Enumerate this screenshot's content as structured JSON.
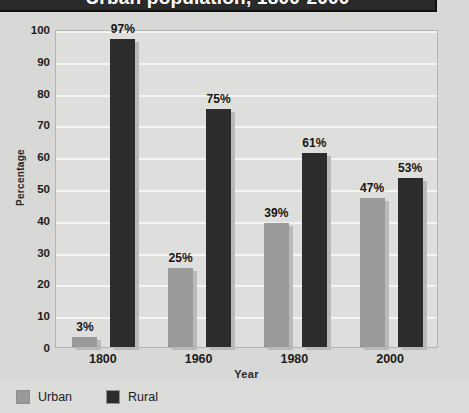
{
  "title": {
    "text": "Urban population, 1800-2000"
  },
  "axes": {
    "y_title": "Percentage",
    "x_title": "Year",
    "y_ticks": [
      "100",
      "90",
      "80",
      "70",
      "60",
      "50",
      "40",
      "30",
      "20",
      "10",
      "0"
    ],
    "x_ticks": [
      "1800",
      "1960",
      "1980",
      "2000"
    ]
  },
  "legend": {
    "items": [
      {
        "label": "Urban",
        "color": "#9a9a9a"
      },
      {
        "label": "Rural",
        "color": "#2c2c2c"
      }
    ]
  },
  "colors": {
    "urban": "#9a9a9a",
    "rural": "#2c2c2c",
    "plot_background": "#dededc",
    "page_background": "#d8d8d6",
    "gridline": "#f4f4f2",
    "banner": "#2a2a2a"
  },
  "bar_labels": {
    "g0_urban": "3%",
    "g0_rural": "97%",
    "g1_urban": "25%",
    "g1_rural": "75%",
    "g2_urban": "39%",
    "g2_rural": "61%",
    "g3_urban": "47%",
    "g3_rural": "53%"
  },
  "chart_data": {
    "type": "bar",
    "title": "Urban population, 1800-2000",
    "xlabel": "Year",
    "ylabel": "Percentage",
    "ylim": [
      0,
      100
    ],
    "ytick_step": 10,
    "grid": true,
    "legend_position": "bottom-left",
    "categories": [
      "1800",
      "1960",
      "1980",
      "2000"
    ],
    "series": [
      {
        "name": "Urban",
        "color": "#9a9a9a",
        "values": [
          3,
          25,
          39,
          47
        ],
        "labels": [
          "3%",
          "25%",
          "39%",
          "47%"
        ]
      },
      {
        "name": "Rural",
        "color": "#2c2c2c",
        "values": [
          97,
          75,
          61,
          53
        ],
        "labels": [
          "97%",
          "75%",
          "61%",
          "53%"
        ]
      }
    ]
  }
}
